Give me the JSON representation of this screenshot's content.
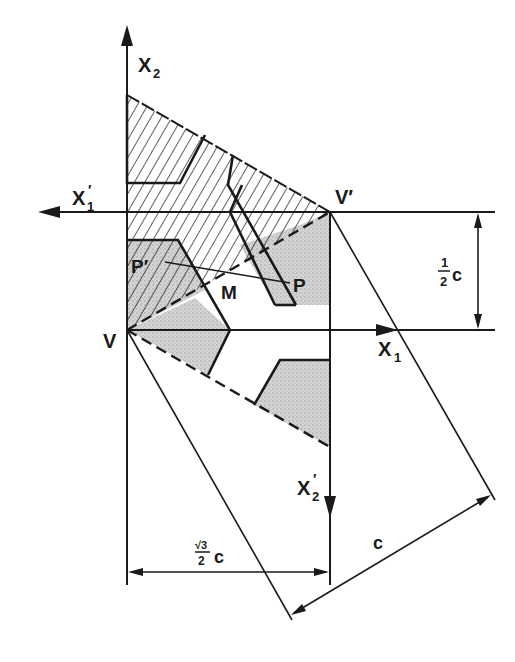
{
  "diagram": {
    "labels": {
      "x2": "X",
      "x2_sub": "2",
      "x1prime": "X",
      "x1prime_sub": "1",
      "x1prime_mark": "′",
      "x1": "X",
      "x1_sub": "1",
      "x2prime": "X",
      "x2prime_sub": "2",
      "x2prime_mark": "′",
      "v": "V",
      "vprime": "V′",
      "p": "P",
      "pprime": "P′",
      "m": "M",
      "half_c_num": "1",
      "half_c_den": "2",
      "half_c_var": "c",
      "sqrt3_num": "√3",
      "sqrt3_den": "2",
      "sqrt3_var": "c",
      "c": "c"
    },
    "colors": {
      "ink": "#1a1a1a",
      "stipple": "#c8c8c8",
      "background": "#ffffff"
    }
  }
}
